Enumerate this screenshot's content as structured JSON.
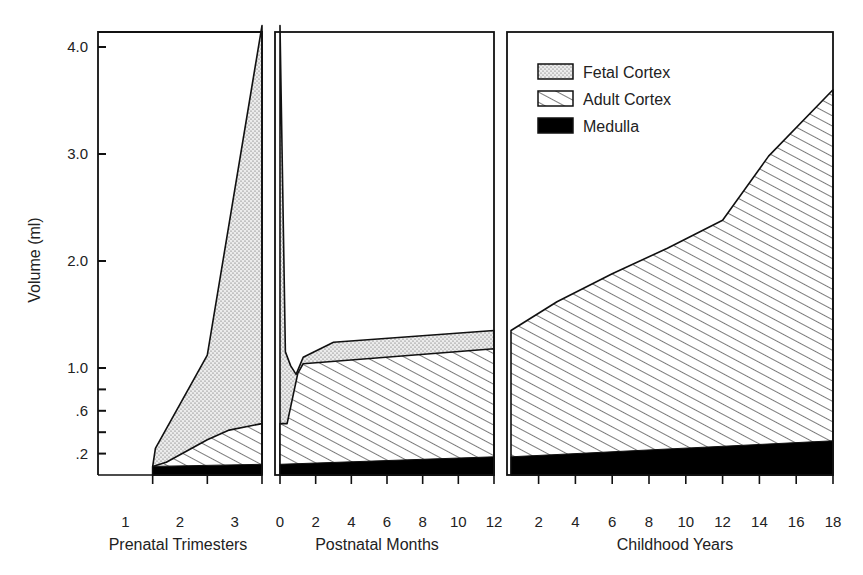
{
  "chart_data": {
    "type": "area",
    "title": "",
    "ylabel": "Volume (ml)",
    "ylim": [
      0,
      4.2
    ],
    "y_ticks": [
      {
        "value": 4.0,
        "label": "4.0"
      },
      {
        "value": 3.0,
        "label": "3.0"
      },
      {
        "value": 2.0,
        "label": "2.0"
      },
      {
        "value": 1.0,
        "label": "1.0"
      },
      {
        "value": 0.8,
        "label": ""
      },
      {
        "value": 0.6,
        "label": ".6"
      },
      {
        "value": 0.4,
        "label": ""
      },
      {
        "value": 0.2,
        "label": ".2"
      }
    ],
    "stacking": "cumulative (Medulla, then Adult Cortex, then Fetal Cortex on top)",
    "legend": {
      "position": "top-right panel",
      "entries": [
        {
          "name": "Fetal Cortex",
          "pattern": "dots"
        },
        {
          "name": "Adult Cortex",
          "pattern": "hatch"
        },
        {
          "name": "Medulla",
          "pattern": "solid"
        }
      ]
    },
    "panels": [
      {
        "id": "prenatal",
        "xlabel": "Prenatal Trimesters",
        "xlim": [
          0.5,
          3.5
        ],
        "x_ticks": [
          {
            "value": 1,
            "label": "1"
          },
          {
            "value": 2,
            "label": "2"
          },
          {
            "value": 3,
            "label": "3"
          }
        ],
        "series": [
          {
            "name": "Medulla (cumulative top)",
            "x": [
              1.5,
              3.5
            ],
            "y": [
              0.08,
              0.1
            ]
          },
          {
            "name": "Adult Cortex (cumulative top)",
            "x": [
              1.5,
              1.75,
              2.5,
              2.9,
              3.5
            ],
            "y": [
              0.08,
              0.12,
              0.33,
              0.42,
              0.48
            ]
          },
          {
            "name": "Fetal Cortex (cumulative top)",
            "x": [
              1.5,
              1.55,
              2.5,
              3.5
            ],
            "y": [
              0.08,
              0.25,
              1.12,
              4.2
            ]
          }
        ]
      },
      {
        "id": "postnatal",
        "xlabel": "Postnatal Months",
        "xlim": [
          0,
          12
        ],
        "x_ticks": [
          {
            "value": 0,
            "label": "0"
          },
          {
            "value": 2,
            "label": "2"
          },
          {
            "value": 4,
            "label": "4"
          },
          {
            "value": 6,
            "label": "6"
          },
          {
            "value": 8,
            "label": "8"
          },
          {
            "value": 10,
            "label": "10"
          },
          {
            "value": 12,
            "label": "12"
          }
        ],
        "series": [
          {
            "name": "Medulla (cumulative top)",
            "x": [
              0,
              12
            ],
            "y": [
              0.1,
              0.17
            ]
          },
          {
            "name": "Adult Cortex (cumulative top)",
            "x": [
              0,
              0.4,
              1.0,
              1.3,
              12
            ],
            "y": [
              0.48,
              0.48,
              0.95,
              1.04,
              1.18
            ]
          },
          {
            "name": "Fetal Cortex (cumulative top)",
            "x": [
              0,
              0.3,
              0.6,
              0.9,
              1.3,
              3.0,
              12
            ],
            "y": [
              4.2,
              1.15,
              1.02,
              0.94,
              1.1,
              1.24,
              1.35
            ]
          }
        ]
      },
      {
        "id": "childhood",
        "xlabel": "Childhood Years",
        "xlim": [
          0.5,
          18
        ],
        "x_ticks": [
          {
            "value": 2,
            "label": "2"
          },
          {
            "value": 4,
            "label": "4"
          },
          {
            "value": 6,
            "label": "6"
          },
          {
            "value": 8,
            "label": "8"
          },
          {
            "value": 10,
            "label": "10"
          },
          {
            "value": 12,
            "label": "12"
          },
          {
            "value": 14,
            "label": "14"
          },
          {
            "value": 16,
            "label": "16"
          },
          {
            "value": 18,
            "label": "18"
          }
        ],
        "series": [
          {
            "name": "Medulla (cumulative top)",
            "x": [
              0.5,
              18
            ],
            "y": [
              0.17,
              0.32
            ]
          },
          {
            "name": "Adult Cortex (cumulative top)",
            "x": [
              0.5,
              3,
              6,
              9,
              12,
              14.5,
              18
            ],
            "y": [
              1.35,
              1.62,
              1.88,
              2.12,
              2.38,
              2.98,
              3.6
            ]
          }
        ]
      }
    ]
  }
}
